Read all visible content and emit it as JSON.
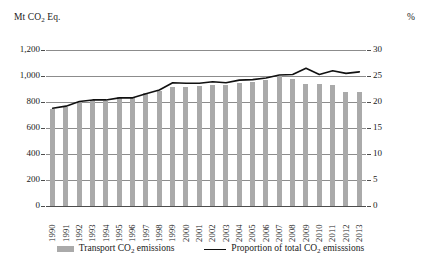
{
  "axis": {
    "left_unit": "Mt CO",
    "left_unit_sub": "2",
    "left_unit_tail": " Eq.",
    "right_unit": "%"
  },
  "legend": {
    "bars_label_head": "Transport CO",
    "bars_label_sub": "2",
    "bars_label_tail": " emissions",
    "line_label_head": "Proportion of total CO",
    "line_label_sub": "2",
    "line_label_tail": " emisssions"
  },
  "colors": {
    "bar": "#aaaaaa",
    "line": "#111111",
    "grid": "#8c8c8c",
    "text": "#1a1a1a"
  },
  "chart_data": {
    "type": "bar",
    "title": "",
    "subtitle": "",
    "xlabel": "",
    "ylabel": "Mt CO2 Eq.",
    "y2label": "%",
    "ylim": [
      0,
      1200
    ],
    "y2lim": [
      0,
      30
    ],
    "yticks": [
      "0",
      "200",
      "400",
      "600",
      "800",
      "1,000",
      "1,200"
    ],
    "ytick_values": [
      0,
      200,
      400,
      600,
      800,
      1000,
      1200
    ],
    "y2ticks": [
      "0",
      "5",
      "10",
      "15",
      "20",
      "25",
      "30"
    ],
    "y2tick_values": [
      0,
      5,
      10,
      15,
      20,
      25,
      30
    ],
    "grid": true,
    "legend_position": "bottom",
    "categories": [
      "1990",
      "1991",
      "1992",
      "1993",
      "1994",
      "1995",
      "1996",
      "1997",
      "1998",
      "1999",
      "2000",
      "2001",
      "2002",
      "2003",
      "2004",
      "2005",
      "2006",
      "2007",
      "2008",
      "2009",
      "2010",
      "2011",
      "2012",
      "2013"
    ],
    "series": [
      {
        "name": "Transport CO2 emissions",
        "type": "bar",
        "axis": "left",
        "unit": "Mt CO2 Eq.",
        "values": [
          750,
          762,
          800,
          812,
          808,
          840,
          842,
          868,
          888,
          915,
          912,
          925,
          928,
          930,
          950,
          952,
          968,
          1000,
          978,
          940,
          938,
          928,
          880,
          880
        ]
      },
      {
        "name": "Proportion of total CO2 emisssions",
        "type": "line",
        "axis": "right",
        "unit": "%",
        "values": [
          18.8,
          19.2,
          20.1,
          20.4,
          20.4,
          20.8,
          20.8,
          21.6,
          22.3,
          23.7,
          23.6,
          23.6,
          23.9,
          23.7,
          24.2,
          24.3,
          24.6,
          25.2,
          25.3,
          26.5,
          25.3,
          26.0,
          25.5,
          25.8
        ]
      }
    ]
  }
}
